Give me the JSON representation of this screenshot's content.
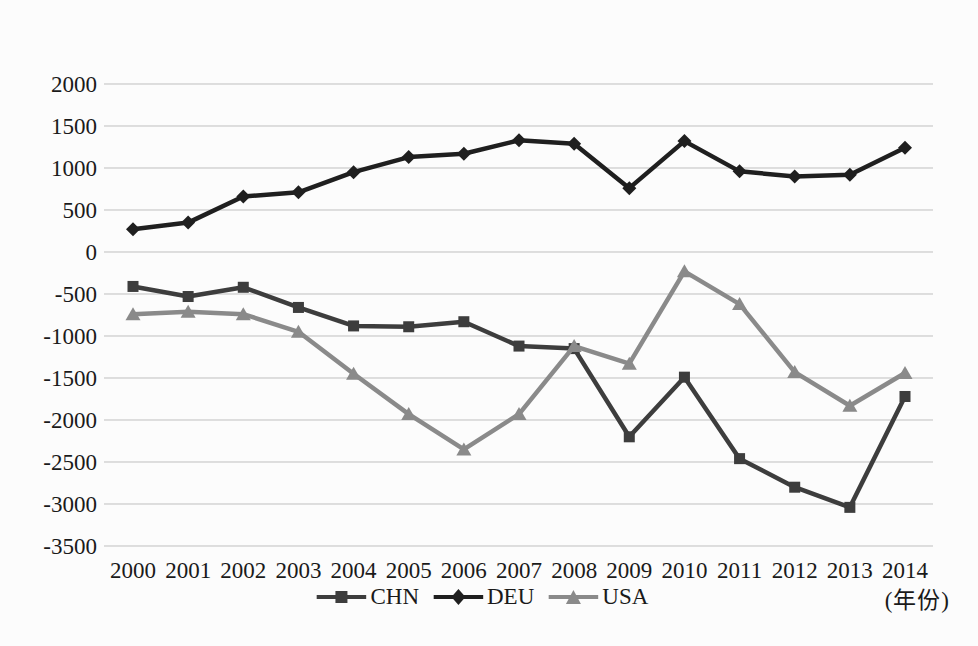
{
  "chart": {
    "y_unit_label": "(亿美元)",
    "x_unit_label": "(年份)"
  },
  "chart_data": {
    "type": "line",
    "title": "",
    "ylabel": "(亿美元)",
    "xlabel": "(年份)",
    "categories": [
      "2000",
      "2001",
      "2002",
      "2003",
      "2004",
      "2005",
      "2006",
      "2007",
      "2008",
      "2009",
      "2010",
      "2011",
      "2012",
      "2013",
      "2014"
    ],
    "y_ticks": [
      2000,
      1500,
      1000,
      500,
      0,
      -500,
      -1000,
      -1500,
      -2000,
      -2500,
      -3000,
      -3500
    ],
    "ylim": [
      -3500,
      2000
    ],
    "grid": "horizontal",
    "legend_position": "bottom",
    "colors": {
      "background": "#fcfcfc",
      "grid": "#bfbfbf",
      "text": "#1a1a1a"
    },
    "series": [
      {
        "name": "CHN",
        "marker": "square",
        "color": "#3d3d3d",
        "values": [
          -410,
          -530,
          -420,
          -660,
          -880,
          -890,
          -830,
          -1120,
          -1150,
          -2200,
          -1490,
          -2460,
          -2800,
          -3040,
          -1720
        ]
      },
      {
        "name": "DEU",
        "marker": "diamond",
        "color": "#1f1f1f",
        "values": [
          270,
          350,
          660,
          710,
          950,
          1130,
          1170,
          1330,
          1290,
          760,
          1320,
          960,
          900,
          920,
          1240
        ]
      },
      {
        "name": "USA",
        "marker": "triangle",
        "color": "#8a8a8a",
        "values": [
          -740,
          -710,
          -740,
          -950,
          -1450,
          -1930,
          -2350,
          -1930,
          -1120,
          -1330,
          -230,
          -620,
          -1430,
          -1830,
          -1440
        ]
      }
    ]
  }
}
